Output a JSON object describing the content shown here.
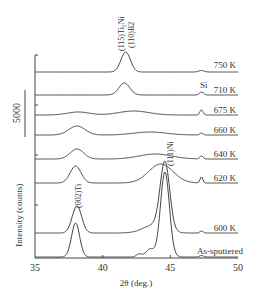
{
  "chart_data": {
    "type": "line",
    "title": "",
    "xlabel": "2θ (deg.)",
    "ylabel": "Intensity (counts)",
    "xlim": [
      35,
      50
    ],
    "xticks": [
      "35",
      "40",
      "45",
      "50"
    ],
    "scale_bar_label": "5000",
    "grid": false,
    "legend": "inline labels at right end of each trace",
    "series": [
      {
        "name": "750 K",
        "baseline_px": 72,
        "peaks": [
          {
            "x": 41.7,
            "h": 20,
            "w": 0.35,
            "label": "(115)Ti2Ni (110)B2"
          },
          {
            "x": 47.3,
            "h": 1.5,
            "w": 0.2
          }
        ]
      },
      {
        "name": "710 K",
        "baseline_px": 95,
        "peaks": [
          {
            "x": 41.6,
            "h": 12,
            "w": 0.4
          },
          {
            "x": 47.3,
            "h": 3,
            "w": 0.15,
            "label": "Si"
          }
        ]
      },
      {
        "name": "675 K",
        "baseline_px": 115,
        "peaks": [
          {
            "x": 38.2,
            "h": 3,
            "w": 0.8
          },
          {
            "x": 42.3,
            "h": 4,
            "w": 1.1
          },
          {
            "x": 47.3,
            "h": 5,
            "w": 0.12
          }
        ]
      },
      {
        "name": "660 K",
        "baseline_px": 135,
        "peaks": [
          {
            "x": 38.1,
            "h": 9,
            "w": 0.6
          },
          {
            "x": 43.5,
            "h": 3,
            "w": 1.2
          },
          {
            "x": 47.3,
            "h": 2,
            "w": 0.12
          }
        ]
      },
      {
        "name": "640 K",
        "baseline_px": 159,
        "peaks": [
          {
            "x": 38.1,
            "h": 10,
            "w": 0.5
          },
          {
            "x": 43.9,
            "h": 5,
            "w": 1.2
          },
          {
            "x": 47.3,
            "h": 3,
            "w": 0.12
          }
        ]
      },
      {
        "name": "620 K",
        "baseline_px": 183,
        "peaks": [
          {
            "x": 38.0,
            "h": 17,
            "w": 0.4
          },
          {
            "x": 44.3,
            "h": 19,
            "w": 0.9
          },
          {
            "x": 47.3,
            "h": 6,
            "w": 0.1
          }
        ]
      },
      {
        "name": "600 K",
        "baseline_px": 233,
        "peaks": [
          {
            "x": 38.1,
            "h": 27,
            "w": 0.35
          },
          {
            "x": 44.6,
            "h": 67,
            "w": 0.35
          },
          {
            "x": 43.8,
            "h": 8,
            "w": 0.8
          },
          {
            "x": 47.3,
            "h": 2,
            "w": 0.12
          }
        ]
      },
      {
        "name": "As-sputtered",
        "baseline_px": 257,
        "peaks": [
          {
            "x": 38.0,
            "h": 34,
            "w": 0.3
          },
          {
            "x": 44.6,
            "h": 85,
            "w": 0.33
          },
          {
            "x": 43.5,
            "h": 8,
            "w": 0.3
          },
          {
            "x": 42.7,
            "h": 3,
            "w": 0.2
          },
          {
            "x": 47.3,
            "h": 1.5,
            "w": 0.15
          }
        ]
      }
    ],
    "annotations": [
      {
        "text": "(115)Ti₂Ni",
        "x": 41.0,
        "rotation": -90
      },
      {
        "text": "(110)B2",
        "x": 41.8,
        "rotation": -90
      },
      {
        "text": "Si",
        "x": 47.3
      },
      {
        "text": "(111)Ni",
        "x": 44.7,
        "rotation": -90
      },
      {
        "text": "(002)Ti",
        "x": 38.1,
        "rotation": -90
      }
    ]
  },
  "labels": {
    "xlabel": "2θ (deg.)",
    "ylabel": "Intensity (counts)",
    "scale": "5000",
    "x35": "35",
    "x40": "40",
    "x45": "45",
    "x50": "50",
    "t750": "750 K",
    "t710": "710 K",
    "t675": "675 K",
    "t660": "660 K",
    "t640": "640 K",
    "t620": "620 K",
    "t600": "600 K",
    "tas": "As-sputtered",
    "ann_ti2ni": "(115)Ti₂Ni",
    "ann_b2": "(110)B2",
    "ann_si": "Si",
    "ann_ni": "(111)Ni",
    "ann_ti": "(002)Ti"
  }
}
